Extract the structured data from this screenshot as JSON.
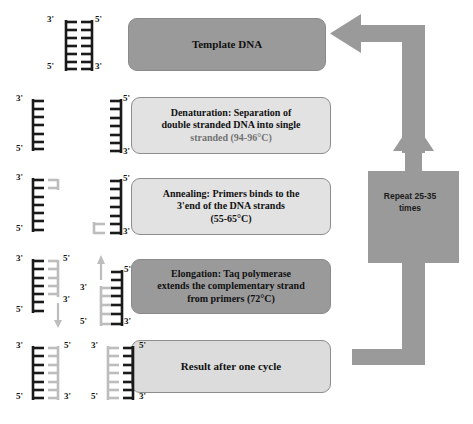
{
  "diagram": {
    "colors": {
      "dark_box": "#9a9a9a",
      "light_box": "#e2e2e2",
      "loop_arrow": "#9a9a9a",
      "template_strand": "#1a1a1a",
      "new_strand": "#b8b8b8",
      "background": "#ffffff"
    }
  },
  "steps": [
    {
      "id": "template",
      "label": "Template DNA",
      "style": "dark"
    },
    {
      "id": "denaturation",
      "label": "Denaturation: Separation of double stranded DNA into single stranded (94-96°C)",
      "lines": [
        "Denaturation: Separation of",
        "double stranded DNA into single",
        "stranded (94-96°C)"
      ],
      "style": "light"
    },
    {
      "id": "annealing",
      "label": "Annealing: Primers binds to the 3'end of the DNA strands (55-65°C)",
      "lines": [
        "Annealing: Primers binds to the",
        "3'end of the DNA strands",
        "(55-65°C)"
      ],
      "style": "light"
    },
    {
      "id": "elongation",
      "label": "Elongation: Taq polymerase extends the complementary strand from primers (72°C)",
      "lines": [
        "Elongation: Taq polymerase",
        "extends the complementary strand",
        "from primers (72°C)"
      ],
      "style": "dark"
    },
    {
      "id": "result",
      "label": "Result after one cycle",
      "style": "pale"
    }
  ],
  "loop": {
    "label_lines": [
      "Repeat 25-35",
      "times"
    ],
    "label": "Repeat 25-35 times"
  },
  "strand_labels": {
    "template": {
      "left_top": "3'",
      "left_bottom": "5'",
      "right_top": "5'",
      "right_bottom": "3'"
    },
    "denaturation_left": {
      "top": "3'",
      "bottom": "5'"
    },
    "denaturation_right": {
      "top": "5'",
      "bottom": "3'"
    },
    "annealing_left": {
      "top": "3'",
      "bottom": "5'"
    },
    "annealing_right": {
      "top": "5'",
      "bottom": "3'"
    },
    "elongation_left": {
      "template_top": "3'",
      "template_bottom": "5'",
      "new_top": "5'",
      "new_bottom": "3'"
    },
    "elongation_right": {
      "new_top": "3'",
      "new_bottom": "5'",
      "template_top": "5'",
      "template_bottom": "3'"
    },
    "result_left": {
      "left_top": "3'",
      "left_bottom": "5'",
      "right_top": "5'",
      "right_bottom": "3'"
    },
    "result_right": {
      "left_top": "3'",
      "left_bottom": "5'",
      "right_top": "5'",
      "right_bottom": "3'"
    }
  }
}
